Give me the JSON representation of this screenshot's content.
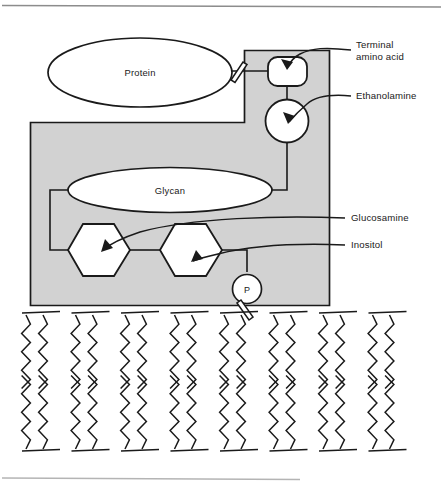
{
  "figure": {
    "background": "#ffffff",
    "ink": "#1a1a1a",
    "shaded_region_fill": "#d2d2d2",
    "shape_fill": "#ffffff",
    "top_rule": true,
    "bottom_rule": true
  },
  "shapes": {
    "protein_label": "Protein",
    "glycan_label": "Glycan",
    "phosphate_label": "P",
    "terminal_amino_acid_shape": "rounded-rectangle",
    "ethanolamine_shape": "circle",
    "glucosamine_shape": "hexagon",
    "inositol_shape": "hexagon"
  },
  "callouts": [
    {
      "id": "terminal-amino-acid",
      "line1": "Terminal",
      "line2": "amino acid",
      "x": 356,
      "y": 45
    },
    {
      "id": "ethanolamine",
      "line1": "Ethanolamine",
      "line2": "",
      "x": 356,
      "y": 99
    },
    {
      "id": "glucosamine",
      "line1": "Glucosamine",
      "line2": "",
      "x": 351,
      "y": 221
    },
    {
      "id": "inositol",
      "line1": "Inositol",
      "line2": "",
      "x": 351,
      "y": 248
    }
  ],
  "membrane": {
    "leaflets": 2,
    "lipids_per_leaflet": 8,
    "lipid_tails_each": 2,
    "description": "phospholipid bilayer drawn as zigzag acyl chains"
  }
}
